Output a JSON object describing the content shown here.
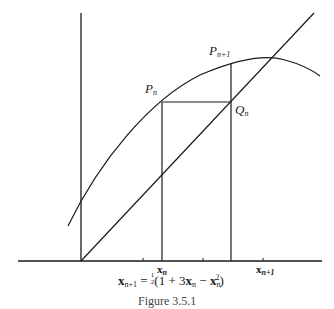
{
  "diagram": {
    "type": "cobweb-iteration",
    "axes": {
      "origin": [
        82,
        261
      ],
      "x_axis": [
        18,
        322
      ],
      "y_axis_top": 13
    },
    "curve": "y = (1 + 3x - x^2)/2",
    "line": "y = x",
    "labels": {
      "pn": {
        "base": "P",
        "sub": "n"
      },
      "pn1": {
        "base": "P",
        "sub": "n+1"
      },
      "qn": {
        "base": "Q",
        "sub": "n"
      },
      "xn": {
        "base": "x",
        "sub": "n"
      },
      "xn1": {
        "base": "x",
        "sub": "n+1"
      }
    },
    "formula": {
      "lhs_base": "x",
      "lhs_sub": "n+1",
      "eq": " = ",
      "frac_num": "1",
      "frac_den": "2",
      "body_open": "(1 + 3",
      "x1": "x",
      "x1_sub": "n",
      "minus": " − ",
      "x2": "x",
      "x2_sub": "n",
      "x2_sup": "2",
      "body_close": ")"
    },
    "caption": "Figure 3.5.1",
    "stroke_color": "#1a1a1a"
  }
}
